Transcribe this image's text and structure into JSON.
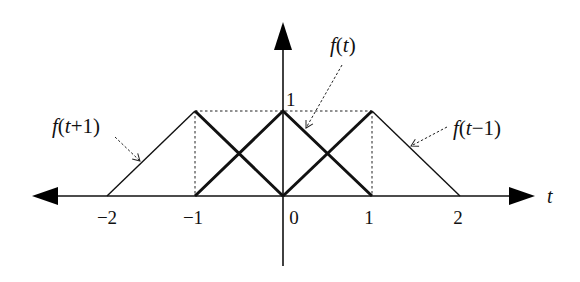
{
  "diagram": {
    "title": "",
    "axis": {
      "x_label": "t",
      "ticks": [
        {
          "value": -2,
          "label": "−2"
        },
        {
          "value": -1,
          "label": "−1"
        },
        {
          "value": 0,
          "label": "0"
        },
        {
          "value": 1,
          "label": "1"
        },
        {
          "value": 2,
          "label": "2"
        }
      ],
      "y_tick_label": "1"
    },
    "functions": [
      {
        "name": "f(t)",
        "label": "f(t)",
        "points": [
          [
            -1,
            0
          ],
          [
            0,
            1
          ],
          [
            1,
            0
          ]
        ],
        "style": "bold"
      },
      {
        "name": "f(t+1)",
        "label": "f(t+1)",
        "points": [
          [
            -2,
            0
          ],
          [
            -1,
            1
          ],
          [
            0,
            0
          ]
        ],
        "style": "bold-overlap-thin"
      },
      {
        "name": "f(t-1)",
        "label": "f(t−1)",
        "points": [
          [
            0,
            0
          ],
          [
            1,
            1
          ],
          [
            2,
            0
          ]
        ],
        "style": "bold-overlap-thin"
      }
    ],
    "guides": {
      "horizontal_dotted_at": 1,
      "vertical_dotted_at": [
        -1,
        1
      ]
    },
    "colors": {
      "stroke": "#111111",
      "background": "#ffffff"
    }
  }
}
